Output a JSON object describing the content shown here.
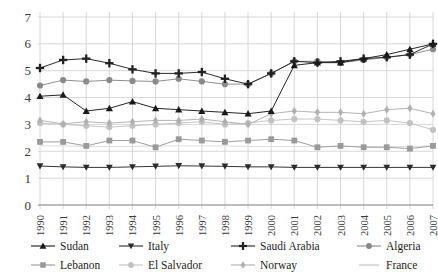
{
  "chart_data": {
    "type": "line",
    "title": "",
    "xlabel": "",
    "ylabel": "",
    "ylim": [
      0,
      7
    ],
    "yticks": [
      0,
      1,
      2,
      3,
      4,
      5,
      6,
      7
    ],
    "grid": true,
    "legend_position": "bottom",
    "x": [
      1990,
      1991,
      1992,
      1993,
      1994,
      1995,
      1996,
      1997,
      1998,
      1999,
      2000,
      2001,
      2002,
      2003,
      2004,
      2005,
      2006,
      2007
    ],
    "categories": [
      "1990",
      "1991",
      "1992",
      "1993",
      "1994",
      "1995",
      "1996",
      "1997",
      "1998",
      "1999",
      "2000",
      "2001",
      "2002",
      "2003",
      "2004",
      "2005",
      "2006",
      "2007"
    ],
    "series": [
      {
        "name": "Sudan",
        "marker": "triangle-up",
        "color": "#1a1a1a",
        "values": [
          4.05,
          4.1,
          3.5,
          3.6,
          3.85,
          3.6,
          3.55,
          3.5,
          3.45,
          3.4,
          3.5,
          5.2,
          5.3,
          5.3,
          5.45,
          5.6,
          5.8,
          6.0
        ]
      },
      {
        "name": "Italy",
        "marker": "triangle-down",
        "color": "#2b2b2b",
        "values": [
          1.45,
          1.42,
          1.4,
          1.4,
          1.42,
          1.44,
          1.46,
          1.45,
          1.44,
          1.42,
          1.42,
          1.4,
          1.4,
          1.4,
          1.4,
          1.4,
          1.4,
          1.4
        ]
      },
      {
        "name": "Saudi Arabia",
        "marker": "plus",
        "color": "#222222",
        "values": [
          5.1,
          5.4,
          5.45,
          5.28,
          5.05,
          4.9,
          4.9,
          4.95,
          4.7,
          4.5,
          4.9,
          5.35,
          5.3,
          5.35,
          5.45,
          5.5,
          5.6,
          6.0
        ]
      },
      {
        "name": "Algeria",
        "marker": "circle",
        "color": "#8a8a8a",
        "values": [
          4.45,
          4.65,
          4.6,
          4.65,
          4.62,
          4.6,
          4.7,
          4.6,
          4.5,
          4.5,
          4.9,
          5.35,
          5.35,
          5.3,
          5.4,
          5.5,
          5.6,
          5.8
        ]
      },
      {
        "name": "Lebanon",
        "marker": "square",
        "color": "#9a9a9a",
        "values": [
          2.35,
          2.35,
          2.2,
          2.4,
          2.4,
          2.15,
          2.45,
          2.4,
          2.35,
          2.4,
          2.45,
          2.4,
          2.15,
          2.2,
          2.15,
          2.15,
          2.1,
          2.2
        ]
      },
      {
        "name": "El Salvador",
        "marker": "circle",
        "color": "#c2c2c2",
        "values": [
          3.05,
          3.0,
          2.95,
          2.9,
          2.95,
          3.0,
          3.05,
          3.1,
          3.0,
          3.05,
          3.15,
          3.2,
          3.2,
          3.15,
          3.1,
          3.15,
          3.05,
          2.8
        ]
      },
      {
        "name": "Norway",
        "marker": "diamond",
        "color": "#b0b0b0",
        "values": [
          3.15,
          3.02,
          3.1,
          3.05,
          3.1,
          3.15,
          3.15,
          3.2,
          3.1,
          3.0,
          3.4,
          3.5,
          3.45,
          3.45,
          3.4,
          3.55,
          3.6,
          3.4
        ]
      },
      {
        "name": "France",
        "marker": "none",
        "color": "#dcdcdc",
        "values": [
          2.2,
          2.2,
          2.18,
          2.18,
          2.18,
          2.2,
          2.2,
          2.2,
          2.2,
          2.18,
          2.18,
          2.18,
          2.18,
          2.18,
          2.18,
          2.18,
          2.18,
          2.2
        ]
      }
    ]
  },
  "legend": {
    "rows": [
      [
        {
          "label": "Sudan",
          "series": 0
        },
        {
          "label": "Italy",
          "series": 1
        },
        {
          "label": "Saudi Arabia",
          "series": 2
        },
        {
          "label": "Algeria",
          "series": 3
        }
      ],
      [
        {
          "label": "Lebanon",
          "series": 4
        },
        {
          "label": "El Salvador",
          "series": 5
        },
        {
          "label": "Norway",
          "series": 6
        },
        {
          "label": "France",
          "series": 7
        }
      ]
    ]
  },
  "axes": {
    "y_labels": [
      "7",
      "6",
      "5",
      "4",
      "3",
      "2",
      "1",
      "0"
    ],
    "x_labels": [
      "1990",
      "1991",
      "1992",
      "1993",
      "1994",
      "1995",
      "1996",
      "1997",
      "1998",
      "1999",
      "2000",
      "2001",
      "2002",
      "2003",
      "2004",
      "2005",
      "2006",
      "2007"
    ]
  },
  "colors": {
    "grid": "#d4d4d4",
    "axis": "#8d8d8d",
    "background": "#ffffff",
    "text": "#2a2a2a"
  }
}
